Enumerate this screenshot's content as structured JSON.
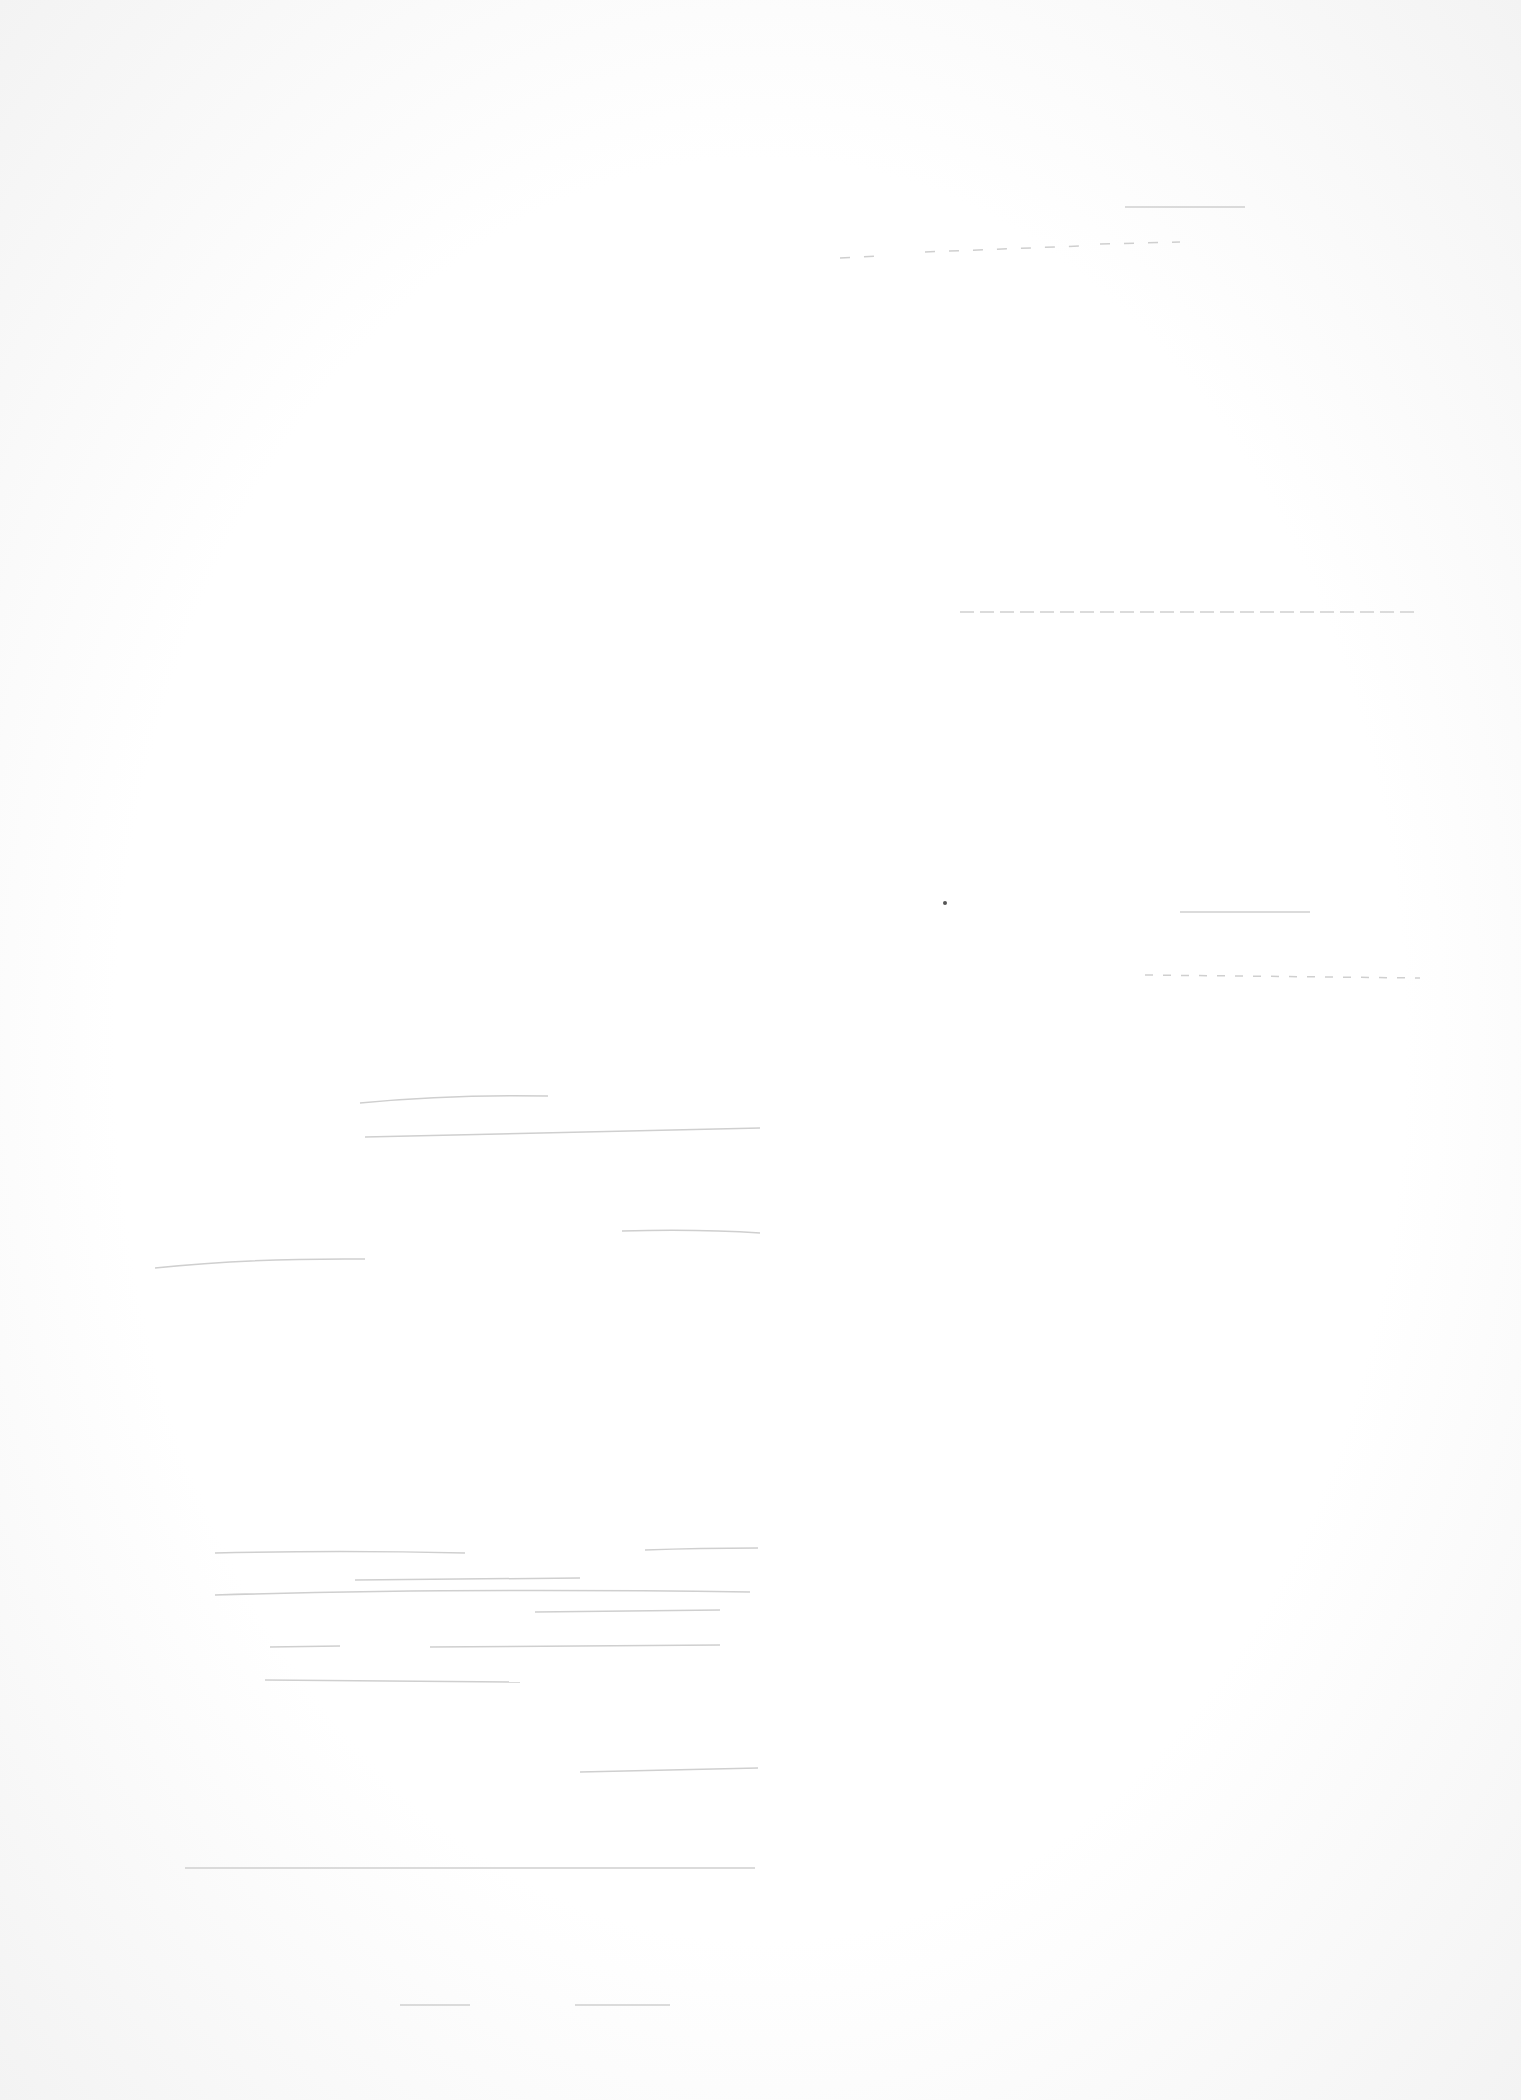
{
  "document": {
    "type": "scanned-blank-page",
    "legible_text": [],
    "stroke_color": "#c8c8c8"
  }
}
